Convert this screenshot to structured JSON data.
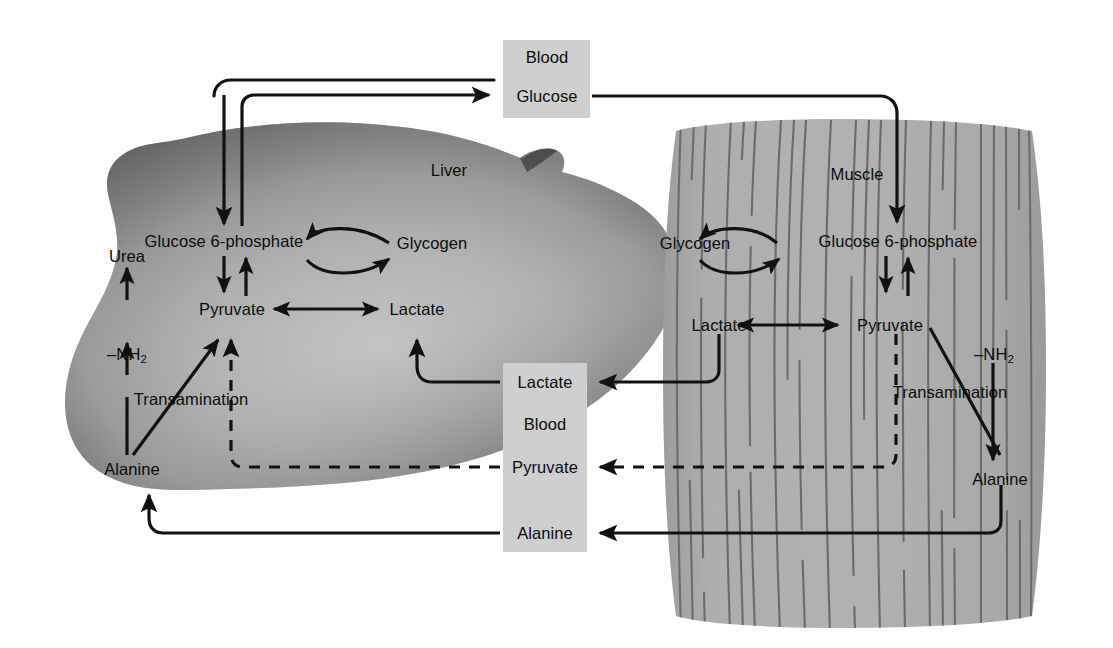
{
  "diagram": {
    "organs": {
      "liver_label": "Liver",
      "muscle_label": "Muscle"
    },
    "colors": {
      "blood_box_fill": "#cfcfcf",
      "muscle_fill": "#aaaaaa",
      "muscle_stripe": "#6e6e6e",
      "liver_dark": "#4a4a4a",
      "liver_light": "#b9b9b9",
      "stroke": "#111111",
      "page_background": "#ffffff"
    },
    "blood_boxes": [
      {
        "id": "blood-top",
        "header": "Blood",
        "items": [
          "Glucose"
        ]
      },
      {
        "id": "blood-bottom",
        "header": "Blood",
        "items": [
          "Lactate",
          "Pyruvate",
          "Alanine"
        ]
      }
    ],
    "liver": {
      "label": "Liver",
      "metabolites": [
        {
          "id": "liver-g6p",
          "name": "Glucose 6-phosphate"
        },
        {
          "id": "liver-glycogen",
          "name": "Glycogen"
        },
        {
          "id": "liver-pyruvate",
          "name": "Pyruvate"
        },
        {
          "id": "liver-lactate",
          "name": "Lactate"
        },
        {
          "id": "liver-urea",
          "name": "Urea"
        },
        {
          "id": "liver-nh2",
          "name": "–NH",
          "subscript": "2"
        },
        {
          "id": "liver-alanine",
          "name": "Alanine"
        }
      ],
      "process_label": "Transamination"
    },
    "muscle": {
      "label": "Muscle",
      "metabolites": [
        {
          "id": "muscle-glycogen",
          "name": "Glycogen"
        },
        {
          "id": "muscle-g6p",
          "name": "Glucose 6-phosphate"
        },
        {
          "id": "muscle-lactate",
          "name": "Lactate"
        },
        {
          "id": "muscle-pyruvate",
          "name": "Pyruvate"
        },
        {
          "id": "muscle-nh2",
          "name": "–NH",
          "subscript": "2"
        },
        {
          "id": "muscle-alanine",
          "name": "Alanine"
        }
      ],
      "process_label": "Transamination"
    },
    "transport_arrows": [
      {
        "from": "liver-g6p-area",
        "to": "blood-glucose",
        "style": "solid",
        "label": ""
      },
      {
        "from": "blood-glucose",
        "to": "muscle-g6p",
        "style": "solid",
        "label": ""
      },
      {
        "from": "muscle-lactate",
        "to": "blood-lactate",
        "style": "solid",
        "label": ""
      },
      {
        "from": "blood-lactate",
        "to": "liver-lactate",
        "style": "solid",
        "label": ""
      },
      {
        "from": "muscle-pyruvate",
        "to": "blood-pyruvate",
        "style": "dashed",
        "label": ""
      },
      {
        "from": "blood-pyruvate",
        "to": "liver-pyruvate",
        "style": "dashed",
        "label": ""
      },
      {
        "from": "muscle-alanine",
        "to": "blood-alanine",
        "style": "solid",
        "label": ""
      },
      {
        "from": "blood-alanine",
        "to": "liver-alanine",
        "style": "solid",
        "label": ""
      }
    ]
  }
}
